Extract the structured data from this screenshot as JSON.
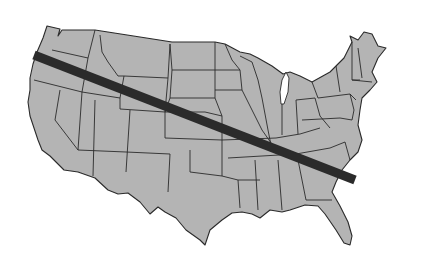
{
  "map": {
    "subject": "Contiguous United States with state borders",
    "land_color": "#b4b4b4",
    "border_color": "#2a2a2a",
    "background_color": "#ffffff",
    "overlay_line": {
      "description": "Thick dark diagonal band from Oregon coast to South Carolina coast",
      "color": "#2b2b2b",
      "start": [
        34,
        55
      ],
      "end": [
        355,
        180
      ],
      "width": 9
    }
  }
}
